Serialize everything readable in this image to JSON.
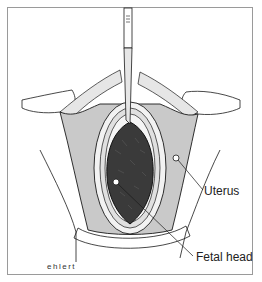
{
  "figure": {
    "labels": [
      {
        "id": "uterus",
        "text": "Uterus",
        "pointer": [
          176,
          158
        ],
        "anchor": [
          204,
          192
        ]
      },
      {
        "id": "fetal_head",
        "text": "Fetal head",
        "pointer": [
          116,
          182
        ],
        "anchor": [
          194,
          258
        ]
      }
    ],
    "signature": "ehlert",
    "colors": {
      "uterus_fill": "#c9c9c9",
      "fetal_head_fill": "#3a3a3a",
      "line": "#1a1a1a",
      "frame": "#9a9a9a"
    }
  }
}
